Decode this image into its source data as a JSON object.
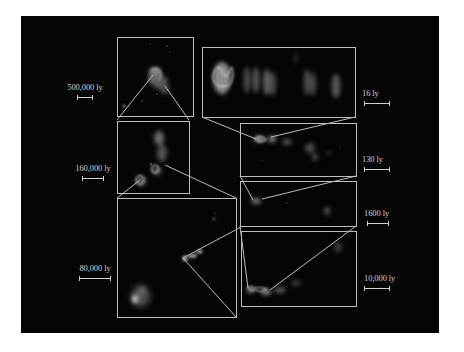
{
  "figure": {
    "background_color": "#050505",
    "frame_color": "#bdbdbd",
    "panels": [
      {
        "id": "A",
        "scale_label": "500,000 ly",
        "description": "galaxy cluster overview"
      },
      {
        "id": "C",
        "scale_label": "160,000 ly",
        "description": "galaxy pair"
      },
      {
        "id": "G",
        "scale_label": "80,000 ly",
        "description": "galaxy with jet"
      },
      {
        "id": "F",
        "scale_label": "10,000 ly",
        "description": "jet structure"
      },
      {
        "id": "E",
        "scale_label": "1600 ly",
        "description": "inner jet"
      },
      {
        "id": "D",
        "scale_label": "130 ly",
        "description": "jet knots"
      },
      {
        "id": "B",
        "scale_label": "16 ly",
        "description": "innermost jet components"
      }
    ]
  },
  "scales": {
    "s500k": "500,000 ly",
    "s160k": "160,000 ly",
    "s80k": "80,000 ly",
    "s16": "16 ly",
    "s130": "130 ly",
    "s1600": "1600 ly",
    "s10k": "10,000 ly"
  }
}
